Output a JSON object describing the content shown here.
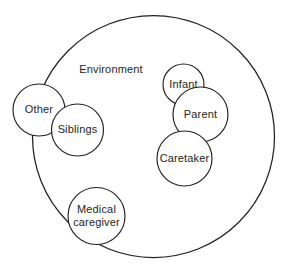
{
  "diagram": {
    "title": "Environment",
    "background_color": "#ffffff",
    "stroke_color": "#231f20",
    "text_color": "#231f20",
    "container": {
      "label": "Environment",
      "label_x": 111,
      "label_y": 70,
      "cx": 153.5,
      "cy": 136.5,
      "r": 121
    },
    "nodes": [
      {
        "id": "other",
        "label": "Other",
        "lines": [
          "Other"
        ],
        "cx": 39,
        "cy": 110,
        "r": 26,
        "inside_environment": false
      },
      {
        "id": "siblings",
        "label": "Siblings",
        "lines": [
          "Siblings"
        ],
        "cx": 77.5,
        "cy": 130,
        "r": 26,
        "inside_environment": true
      },
      {
        "id": "medical-caregiver",
        "label": "Medical caregiver",
        "lines": [
          "Medical",
          "caregiver"
        ],
        "cx": 96.5,
        "cy": 216,
        "r": 28.5,
        "inside_environment": true
      },
      {
        "id": "infant",
        "label": "Infant",
        "lines": [
          "Infant"
        ],
        "cx": 183.5,
        "cy": 84.5,
        "r": 20.5,
        "inside_environment": true
      },
      {
        "id": "parent",
        "label": "Parent",
        "lines": [
          "Parent"
        ],
        "cx": 200.5,
        "cy": 114.5,
        "r": 27.5,
        "inside_environment": true
      },
      {
        "id": "caretaker",
        "label": "Caretaker",
        "lines": [
          "Caretaker"
        ],
        "cx": 184.5,
        "cy": 158.5,
        "r": 27.5,
        "inside_environment": true
      }
    ]
  }
}
